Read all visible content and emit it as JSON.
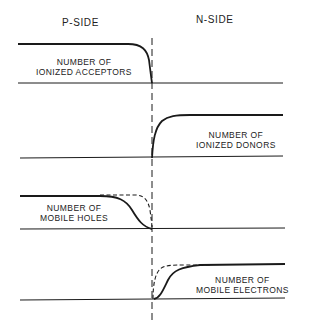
{
  "diagram": {
    "headers": {
      "left": "P-SIDE",
      "right": "N-SIDE"
    },
    "panels": [
      {
        "id": "acceptors",
        "label_line1": "NUMBER OF",
        "label_line2": "IONIZED ACCEPTORS"
      },
      {
        "id": "donors",
        "label_line1": "NUMBER OF",
        "label_line2": "IONIZED DONORS"
      },
      {
        "id": "holes",
        "label_line1": "NUMBER OF",
        "label_line2": "MOBILE HOLES"
      },
      {
        "id": "electrons",
        "label_line1": "NUMBER OF",
        "label_line2": "MOBILE ELECTRONS"
      }
    ],
    "colors": {
      "line": "#1a1a1a",
      "background": "#ffffff"
    }
  }
}
